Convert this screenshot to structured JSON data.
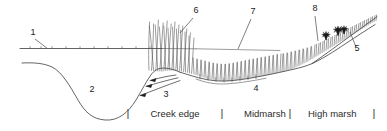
{
  "figure": {
    "callouts": [
      {
        "id": "1",
        "label": "1",
        "x": 33,
        "y": 35,
        "target": "water-surface-line"
      },
      {
        "id": "2",
        "label": "2",
        "x": 92,
        "y": 92,
        "target": "tidal-creek-channel"
      },
      {
        "id": "3",
        "label": "3",
        "x": 166,
        "y": 97,
        "target": "tidal-flow-arrows"
      },
      {
        "id": "4",
        "label": "4",
        "x": 256,
        "y": 91,
        "target": "marsh-platform"
      },
      {
        "id": "5",
        "label": "5",
        "x": 357,
        "y": 51,
        "target": "upland-border"
      },
      {
        "id": "6",
        "label": "6",
        "x": 196,
        "y": 13,
        "target": "tall-creekside-grass"
      },
      {
        "id": "7",
        "label": "7",
        "x": 253,
        "y": 14,
        "target": "midmarsh-grass"
      },
      {
        "id": "8",
        "label": "8",
        "x": 315,
        "y": 11,
        "target": "high-marsh-shrubs"
      }
    ],
    "zones": [
      {
        "label": "Creek edge",
        "x": 175,
        "y": 117
      },
      {
        "label": "Midmarsh",
        "x": 244,
        "y": 117
      },
      {
        "label": "High marsh",
        "x": 325,
        "y": 117
      }
    ],
    "zone_dividers": [
      {
        "label": "|",
        "x": 128,
        "y": 117
      },
      {
        "label": "|",
        "x": 222,
        "y": 117
      },
      {
        "label": "|",
        "x": 279,
        "y": 117
      },
      {
        "label": "|",
        "x": 374,
        "y": 117
      }
    ],
    "colors": {
      "ink": "#3c3c3c",
      "text": "#1a1a1a",
      "shrub": "#1c1c1c",
      "background": "#ffffff"
    }
  }
}
